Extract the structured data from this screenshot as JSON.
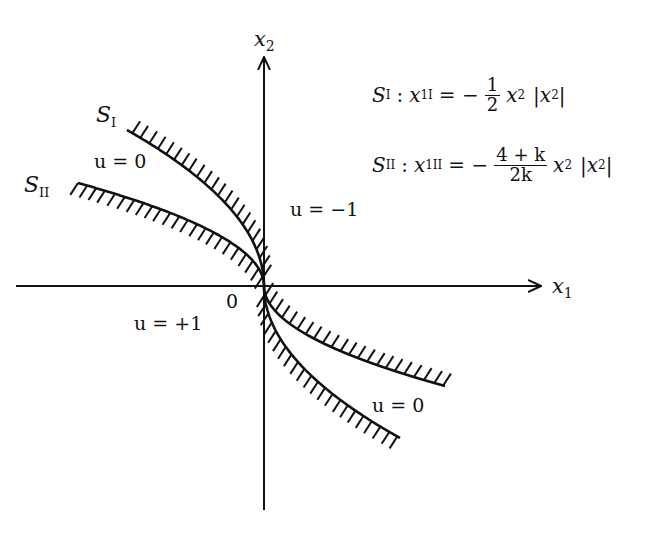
{
  "diagram": {
    "axes": {
      "x_axis_label": "x",
      "x_axis_sub": "1",
      "y_axis_label": "x",
      "y_axis_sub": "2",
      "origin_label": "0"
    },
    "curves": [
      {
        "id": "S_I",
        "label": "S",
        "label_sub": "I"
      },
      {
        "id": "S_II",
        "label": "S",
        "label_sub": "II"
      }
    ],
    "region_labels": {
      "upper_left": "u = 0",
      "upper_right": "u = −1",
      "lower_left": "u = +1",
      "lower_right": "u = 0"
    },
    "equations": {
      "s1": {
        "lhs_var": "S",
        "lhs_sub": "I",
        "colon": ":",
        "x_var": "x",
        "x_sub": "1I",
        "equals": "= −",
        "frac_num": "1",
        "frac_den": "2",
        "rhs": "x",
        "rhs_sub": "2",
        "abs": "|x",
        "abs_sub": "2",
        "abs_close": "|"
      },
      "s2": {
        "lhs_var": "S",
        "lhs_sub": "II",
        "colon": ":",
        "x_var": "x",
        "x_sub": "1II",
        "equals": "= −",
        "frac_num": "4 + k",
        "frac_den": "2k",
        "rhs": "x",
        "rhs_sub": "2",
        "abs": "|x",
        "abs_sub": "2",
        "abs_close": "|"
      }
    }
  }
}
